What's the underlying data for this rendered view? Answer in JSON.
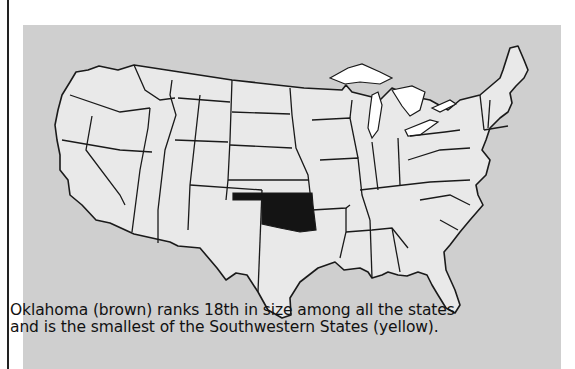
{
  "map": {
    "title": "United States map",
    "highlight_state": "Oklahoma",
    "colors": {
      "panel_background": "#cfcfcf",
      "land": "#e9e9e9",
      "highlight": "#141414",
      "lakes": "#ffffff",
      "border": "#1a1a1a"
    }
  },
  "caption": {
    "line1": "Oklahoma (brown) ranks 18th in size among all the states",
    "line2": "and is the smallest of the Southwestern States (yellow)."
  }
}
